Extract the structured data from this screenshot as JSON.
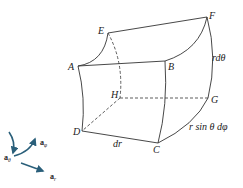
{
  "diagram": {
    "vertices": {
      "A": {
        "label": "A"
      },
      "B": {
        "label": "B"
      },
      "C": {
        "label": "C"
      },
      "D": {
        "label": "D"
      },
      "E": {
        "label": "E"
      },
      "F": {
        "label": "F"
      },
      "G": {
        "label": "G"
      },
      "H": {
        "label": "H"
      }
    },
    "dimensions": {
      "r_dtheta": "rdθ",
      "r_sin_theta_dphi": "r sin θ dφ",
      "dr": "dr"
    },
    "unit_vectors": {
      "theta": {
        "base": "a",
        "sub": "θ"
      },
      "phi": {
        "base": "a",
        "sub": "φ"
      },
      "r": {
        "base": "a",
        "sub": "r"
      }
    },
    "colors": {
      "line": "#333333",
      "arrow": "#2a5f7a"
    }
  }
}
